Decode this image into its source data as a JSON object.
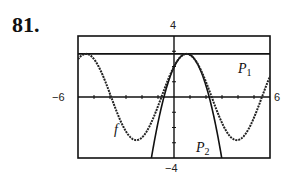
{
  "problem_number": "81.",
  "window": {
    "xmin_label": "−6",
    "xmax_label": "6",
    "ymin_label": "−4",
    "ymax_label": "4"
  },
  "labels": {
    "f": "f",
    "p1": "P",
    "p1_sub": "1",
    "p2": "P",
    "p2_sub": "2"
  },
  "chart_data": {
    "type": "line",
    "title": "",
    "xlabel": "",
    "ylabel": "",
    "xlim": [
      -6,
      6
    ],
    "ylim": [
      -4,
      4
    ],
    "xtick_step": 1,
    "ytick_step": 1,
    "grid": false,
    "legend": "inline labels",
    "series": [
      {
        "name": "f",
        "expression": "2(sin x + cos x)",
        "style": "dotted-thick"
      },
      {
        "name": "P1",
        "expression": "2√2",
        "center": 0.7854,
        "style": "solid"
      },
      {
        "name": "P2",
        "expression": "2√2 − √2(x − π/4)²",
        "center": 0.7854,
        "style": "solid"
      }
    ]
  }
}
